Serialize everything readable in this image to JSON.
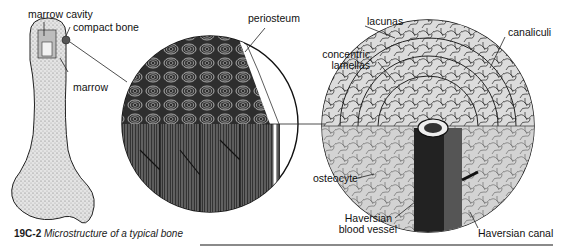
{
  "figure": {
    "number": "19C-2",
    "title": "Microstructure of a typical bone"
  },
  "panels": [
    {
      "name": "bone",
      "labels": [
        "marrow cavity",
        "compact bone",
        "marrow"
      ]
    },
    {
      "name": "compact-bone-section",
      "labels": [
        "periosteum"
      ]
    },
    {
      "name": "osteon-detail",
      "labels": [
        "lacunas",
        "canaliculi",
        "concentric lamellas",
        "osteocyte",
        "Haversian blood vessel",
        "Haversian canal"
      ]
    }
  ],
  "labels": {
    "marrow_cavity": "marrow cavity",
    "compact_bone": "compact bone",
    "marrow": "marrow",
    "periosteum": "periosteum",
    "lacunas": "lacunas",
    "canaliculi": "canaliculi",
    "concentric_1": "concentric",
    "concentric_2": "lamellas",
    "osteocyte": "osteocyte",
    "haversian_bv_1": "Haversian",
    "haversian_bv_2": "blood vessel",
    "haversian_canal": "Haversian canal"
  },
  "colors": {
    "ink": "#1a1a1a",
    "bone_fill": "#d8d8d8",
    "dark_section": "#3a3a3a",
    "light_section": "#e6e6e6",
    "rule": "#8a8a8a"
  }
}
